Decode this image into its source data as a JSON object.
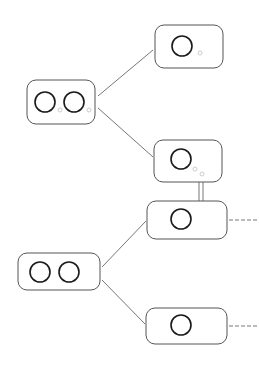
{
  "diagram": {
    "colors": {
      "background": "#ffffff",
      "box_stroke": "#555555",
      "circle_stroke": "#1a1a1a",
      "connector": "#777777",
      "small_dot": "#cccccc",
      "dashed": "#777777"
    },
    "nodes": [
      {
        "id": "A",
        "type": "pair",
        "x": 27,
        "y": 80,
        "w": 68,
        "h": 44,
        "circles": 2,
        "small_dots": 2
      },
      {
        "id": "B",
        "type": "single",
        "x": 155,
        "y": 25,
        "w": 68,
        "h": 43,
        "circles": 1,
        "small_dots": 1
      },
      {
        "id": "C",
        "type": "single",
        "x": 154,
        "y": 140,
        "w": 68,
        "h": 42,
        "circles": 1,
        "small_dots": 2
      },
      {
        "id": "D",
        "type": "single",
        "x": 147,
        "y": 201,
        "w": 80,
        "h": 38,
        "circles": 1,
        "small_dots": 0,
        "dashed_exit": true
      },
      {
        "id": "E",
        "type": "pair",
        "x": 18,
        "y": 253,
        "w": 82,
        "h": 37,
        "circles": 2,
        "small_dots": 0
      },
      {
        "id": "F",
        "type": "single",
        "x": 146,
        "y": 308,
        "w": 81,
        "h": 36,
        "circles": 1,
        "small_dots": 0,
        "dashed_exit": true
      }
    ],
    "edges": [
      {
        "from": "A",
        "to": "B",
        "style": "solid"
      },
      {
        "from": "A",
        "to": "C",
        "style": "solid"
      },
      {
        "from": "C",
        "to": "D",
        "style": "double"
      },
      {
        "from": "E",
        "to": "D",
        "style": "solid"
      },
      {
        "from": "E",
        "to": "F",
        "style": "solid"
      },
      {
        "from": "D",
        "to": "offscreen",
        "style": "dashed"
      },
      {
        "from": "F",
        "to": "offscreen",
        "style": "dashed"
      }
    ]
  }
}
